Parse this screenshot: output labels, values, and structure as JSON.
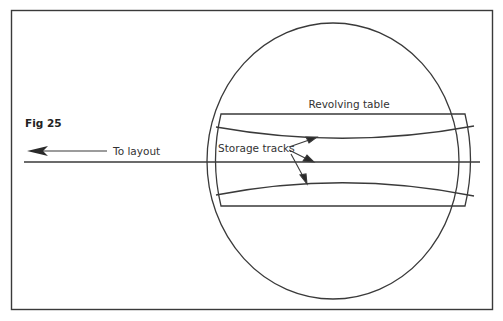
{
  "figure": {
    "label": "Fig 25",
    "labels": {
      "table": "Revolving table",
      "tracks": "Storage tracks",
      "layout": "To layout"
    },
    "colors": {
      "line": "#3a3a3a",
      "background": "#ffffff"
    }
  }
}
